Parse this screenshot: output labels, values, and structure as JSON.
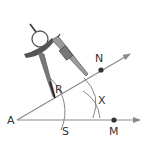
{
  "diagram": {
    "colors": {
      "ray": "#8a8a8a",
      "arc": "#777777",
      "point": "#333333",
      "label": "#333333",
      "compass_body": "#555555",
      "compass_light": "#bdbdbd"
    },
    "labels": {
      "A": "A",
      "N": "N",
      "M": "M",
      "R": "R",
      "S": "S",
      "X": "X"
    },
    "points": [
      {
        "name": "A",
        "x": 17,
        "y": 120
      },
      {
        "name": "N",
        "x": 101,
        "y": 70
      },
      {
        "name": "M",
        "x": 114,
        "y": 120
      },
      {
        "name": "R",
        "x": 54,
        "y": 98
      },
      {
        "name": "S",
        "x": 60,
        "y": 120
      },
      {
        "name": "X",
        "x": 96,
        "y": 101
      }
    ],
    "rays": [
      {
        "from": "A",
        "through": "M",
        "direction": "horizontal"
      },
      {
        "from": "A",
        "through": "N",
        "direction": "upper"
      }
    ],
    "tool": "compass"
  }
}
